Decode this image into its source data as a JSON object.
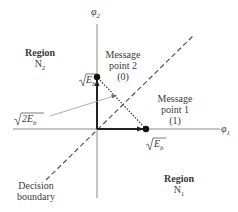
{
  "diagram": {
    "axes": {
      "x_label": "φ",
      "x_sub": "1",
      "y_label": "φ",
      "y_sub": "2"
    },
    "regions": [
      {
        "title": "Region",
        "name": "N",
        "sub": "2"
      },
      {
        "title": "Region",
        "name": "N",
        "sub": "1"
      }
    ],
    "points": [
      {
        "line1": "Message",
        "line2": "point 2",
        "line3": "(0)"
      },
      {
        "line1": "Message",
        "line2": "point 1",
        "line3": "(1)"
      }
    ],
    "labels": {
      "sqrt_eb_y": "E",
      "sqrt_eb_x": "E",
      "eb_sub": "b",
      "sqrt_2eb": "2E",
      "decision_1": "Decision",
      "decision_2": "boundary"
    },
    "colors": {
      "axis": "#8a8a8a",
      "vector": "#222222",
      "dashed": "#555555",
      "text": "#3a3a3a"
    }
  }
}
